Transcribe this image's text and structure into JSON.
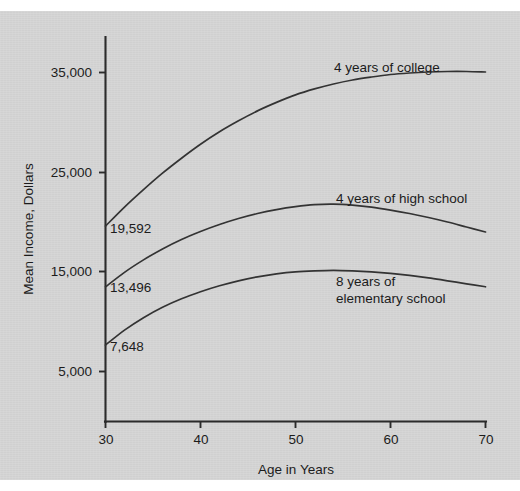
{
  "chart_data": {
    "type": "line",
    "title": "",
    "xlabel": "Age in Years",
    "ylabel": "Mean Income, Dollars",
    "xlim": [
      30,
      70
    ],
    "ylim": [
      3000,
      37500
    ],
    "grid": false,
    "legend_position": "inline-annotations",
    "x_ticks": [
      30,
      40,
      50,
      60,
      70
    ],
    "x_tick_labels": [
      "30",
      "40",
      "50",
      "60",
      "70"
    ],
    "y_ticks": [
      5000,
      15000,
      25000,
      35000
    ],
    "y_tick_labels": [
      "5,000",
      "15,000",
      "25,000",
      "35,000"
    ],
    "series": [
      {
        "name": "4 years of college",
        "label": "4 years of college",
        "start_value": 19592,
        "start_value_label": "19,592",
        "x": [
          30,
          32,
          34,
          36,
          38,
          40,
          42,
          44,
          46,
          48,
          50,
          52,
          54,
          56,
          58,
          60,
          62,
          64,
          66,
          68,
          70
        ],
        "values": [
          19592,
          21500,
          23250,
          24900,
          26400,
          27800,
          29050,
          30150,
          31150,
          32000,
          32750,
          33350,
          33850,
          34250,
          34550,
          34800,
          34950,
          35050,
          35100,
          35100,
          35050
        ]
      },
      {
        "name": "4 years of high school",
        "label": "4 years of high school",
        "start_value": 13496,
        "start_value_label": "13,496",
        "x": [
          30,
          32,
          34,
          36,
          38,
          40,
          42,
          44,
          46,
          48,
          50,
          52,
          54,
          56,
          58,
          60,
          62,
          64,
          66,
          68,
          70
        ],
        "values": [
          13496,
          14950,
          16200,
          17300,
          18250,
          19050,
          19750,
          20350,
          20850,
          21250,
          21550,
          21750,
          21800,
          21700,
          21500,
          21200,
          20850,
          20450,
          20000,
          19500,
          19000
        ]
      },
      {
        "name": "8 years of elementary school",
        "label_line1": "8 years of",
        "label_line2": "elementary school",
        "start_value": 7648,
        "start_value_label": "7,648",
        "x": [
          30,
          32,
          34,
          36,
          38,
          40,
          42,
          44,
          46,
          48,
          50,
          52,
          54,
          56,
          58,
          60,
          62,
          64,
          66,
          68,
          70
        ],
        "values": [
          7648,
          9150,
          10400,
          11450,
          12300,
          13000,
          13600,
          14100,
          14500,
          14800,
          15000,
          15100,
          15150,
          15100,
          15000,
          14850,
          14650,
          14400,
          14100,
          13800,
          13500
        ]
      }
    ],
    "colors": {
      "background": "#d3d3d3",
      "curve": "#333333",
      "axis": "#2b2b2b",
      "text": "#1c1c1c"
    }
  },
  "annotations": {
    "college_label": "4 years of college",
    "highschool_label": "4 years of high school",
    "elementary_label_line1": "8 years of",
    "elementary_label_line2": "elementary school",
    "value_19592": "19,592",
    "value_13496": "13,496",
    "value_7648": "7,648"
  },
  "axes": {
    "y_title": "Mean Income, Dollars",
    "x_title": "Age in Years",
    "y_labels": [
      "35,000",
      "25,000",
      "15,000",
      "5,000"
    ],
    "x_labels": [
      "30",
      "40",
      "50",
      "60",
      "70"
    ]
  }
}
